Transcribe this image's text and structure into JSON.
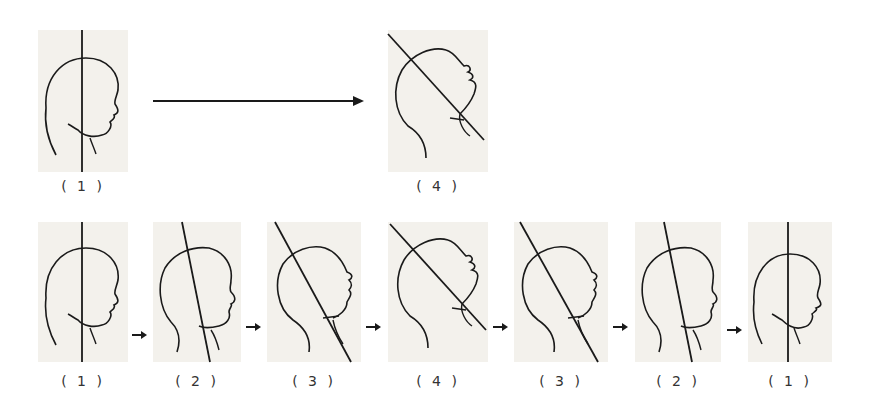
{
  "diagram": {
    "title": "",
    "colors": {
      "panel_bg": "#f3f1ec",
      "line": "#1a1a1a",
      "label": "#333333"
    },
    "top_row": {
      "figures": [
        {
          "id": "top-1",
          "label": "( 1 )",
          "step": 1,
          "tilt_deg": 0
        },
        {
          "id": "top-4",
          "label": "( 4 )",
          "step": 4,
          "tilt_deg": 40
        }
      ],
      "connector": {
        "type": "long-arrow",
        "from": "top-1",
        "to": "top-4"
      }
    },
    "bottom_row": {
      "figures": [
        {
          "id": "b1",
          "label": "( 1 )",
          "step": 1,
          "tilt_deg": 0
        },
        {
          "id": "b2",
          "label": "( 2 )",
          "step": 2,
          "tilt_deg": 12
        },
        {
          "id": "b3",
          "label": "( 3 )",
          "step": 3,
          "tilt_deg": 28
        },
        {
          "id": "b4",
          "label": "( 4 )",
          "step": 4,
          "tilt_deg": 40
        },
        {
          "id": "b5",
          "label": "( 3 )",
          "step": 3,
          "tilt_deg": 28
        },
        {
          "id": "b6",
          "label": "( 2 )",
          "step": 2,
          "tilt_deg": 12
        },
        {
          "id": "b7",
          "label": "( 1 )",
          "step": 1,
          "tilt_deg": 0
        }
      ],
      "connector": {
        "type": "small-arrow",
        "count": 6
      }
    }
  }
}
